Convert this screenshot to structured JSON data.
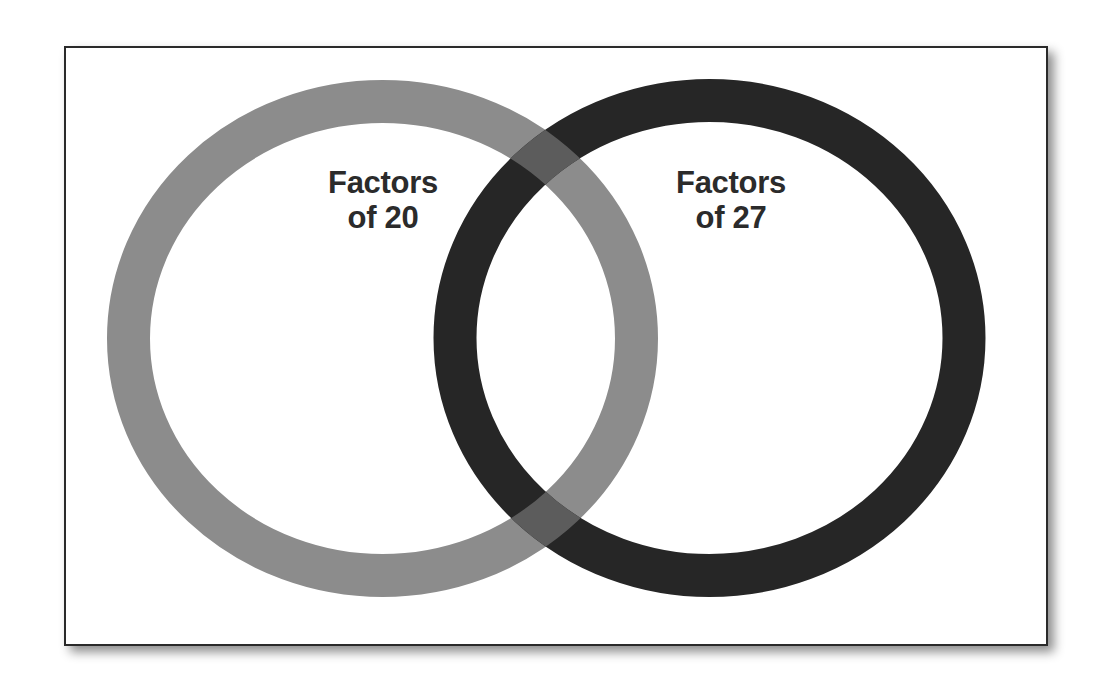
{
  "diagram": {
    "type": "venn",
    "sets": [
      {
        "id": "left",
        "label_line1": "Factors",
        "label_line2": "of 20",
        "color": "#8c8c8c"
      },
      {
        "id": "right",
        "label_line1": "Factors",
        "label_line2": "of 27",
        "color": "#262626"
      }
    ],
    "overlap_color": "#5c5c5c",
    "frame_border_color": "#2a2a2a",
    "background": "#ffffff"
  }
}
